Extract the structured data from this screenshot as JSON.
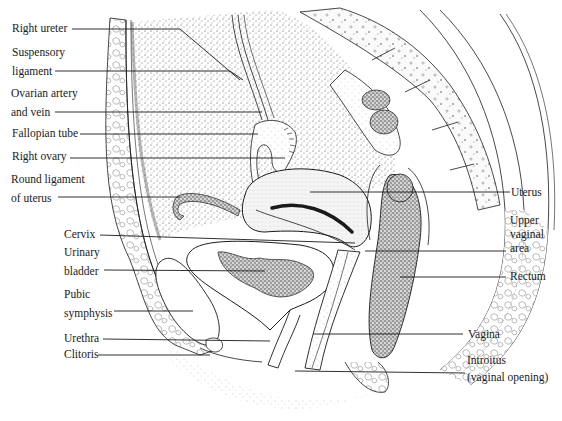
{
  "figure": {
    "type": "anatomical-illustration"
  },
  "labels_left": [
    {
      "id": "right-ureter",
      "lines": [
        "Right ureter"
      ]
    },
    {
      "id": "suspensory-ligament",
      "lines": [
        "Suspensory",
        "ligament"
      ]
    },
    {
      "id": "ovarian-artery-vein",
      "lines": [
        "Ovarian artery",
        "and vein"
      ]
    },
    {
      "id": "fallopian-tube",
      "lines": [
        "Fallopian tube"
      ]
    },
    {
      "id": "right-ovary",
      "lines": [
        "Right ovary"
      ]
    },
    {
      "id": "round-ligament",
      "lines": [
        "Round ligament",
        "of uterus"
      ]
    },
    {
      "id": "cervix",
      "lines": [
        "Cervix"
      ]
    },
    {
      "id": "urinary-bladder",
      "lines": [
        "Urinary",
        "bladder"
      ]
    },
    {
      "id": "pubic-symphysis",
      "lines": [
        "Pubic",
        "symphysis"
      ]
    },
    {
      "id": "urethra",
      "lines": [
        "Urethra"
      ]
    },
    {
      "id": "clitoris",
      "lines": [
        "Clitoris"
      ]
    }
  ],
  "labels_right": [
    {
      "id": "uterus",
      "lines": [
        "Uterus"
      ]
    },
    {
      "id": "upper-vaginal-area",
      "lines": [
        "Upper",
        "vaginal",
        "area"
      ]
    },
    {
      "id": "rectum",
      "lines": [
        "Rectum"
      ]
    },
    {
      "id": "vagina",
      "lines": [
        "Vagina"
      ]
    },
    {
      "id": "introitus",
      "lines": [
        "Introitus",
        "(vaginal opening)"
      ]
    }
  ],
  "colors": {
    "ink": "#1a1a1a",
    "background": "#ffffff",
    "stipple_dark": "#3a3a3a",
    "stipple_light": "#bdbdbd"
  }
}
